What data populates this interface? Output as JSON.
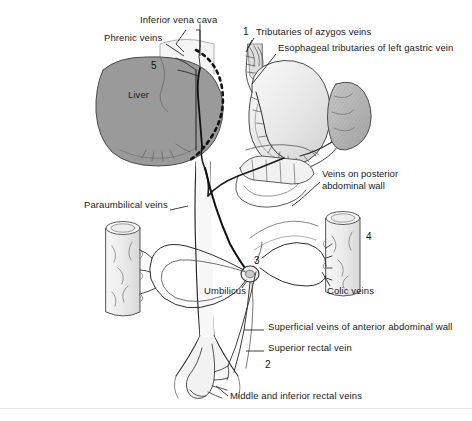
{
  "figure": {
    "domain": "diagram",
    "background_color": "#ffffff",
    "frame_line_color": "#e9e9e9",
    "ink_color": "#1a1a1a"
  },
  "palette": {
    "liver_fill": "#9a9a9a",
    "stomach_fill": "#e2e2e2",
    "spleen_fill": "#b4b4b4",
    "organ_light": "#f0f0f0",
    "wall_block_fill": "#ededed",
    "vessel_stroke": "#2b2b2b",
    "outline": "#3a3a3a"
  },
  "labels": [
    {
      "id": "inferior-vena-cava",
      "text": "Inferior vena cava",
      "x": 140,
      "y": 20
    },
    {
      "id": "phrenic-veins",
      "text": "Phrenic veins",
      "x": 104,
      "y": 38
    },
    {
      "id": "tributaries-azygos",
      "text": "Tributaries of azygos veins",
      "x": 256,
      "y": 32
    },
    {
      "id": "esophageal-left-gastric",
      "text": "Esophageal tributaries of left gastric vein",
      "x": 278,
      "y": 48
    },
    {
      "id": "veins-posterior-abdominal-wall",
      "text": "Veins on posterior\nabdominal wall",
      "x": 322,
      "y": 174
    },
    {
      "id": "paraumbilical-veins",
      "text": "Paraumbilical veins",
      "x": 84,
      "y": 205
    },
    {
      "id": "umbilicus",
      "text": "Umbilicus",
      "x": 204,
      "y": 291
    },
    {
      "id": "colic-veins",
      "text": "Colic veins",
      "x": 327,
      "y": 291
    },
    {
      "id": "superficial-veins-anterior-wall",
      "text": "Superficial veins of anterior abdominal wall",
      "x": 268,
      "y": 327
    },
    {
      "id": "superior-rectal-vein",
      "text": "Superior rectal vein",
      "x": 268,
      "y": 348
    },
    {
      "id": "middle-inferior-rectal-veins",
      "text": "Middle and inferior rectal veins",
      "x": 230,
      "y": 396
    },
    {
      "id": "liver",
      "text": "Liver",
      "x": 128,
      "y": 95
    }
  ],
  "numbers": [
    {
      "id": "marker-1",
      "text": "1",
      "x": 243,
      "y": 32
    },
    {
      "id": "marker-5",
      "text": "5",
      "x": 151,
      "y": 66
    },
    {
      "id": "marker-4",
      "text": "4",
      "x": 366,
      "y": 237
    },
    {
      "id": "marker-3",
      "text": "3",
      "x": 254,
      "y": 261
    },
    {
      "id": "marker-2",
      "text": "2",
      "x": 265,
      "y": 365
    }
  ],
  "structures": [
    {
      "id": "liver",
      "name": "liver"
    },
    {
      "id": "stomach",
      "name": "stomach"
    },
    {
      "id": "spleen",
      "name": "spleen"
    },
    {
      "id": "esophagus",
      "name": "esophagus"
    },
    {
      "id": "pancreas-duodenum",
      "name": "pancreas-and-duodenum"
    },
    {
      "id": "small-intestine",
      "name": "small-intestine-loops"
    },
    {
      "id": "transverse-colon",
      "name": "transverse-colon"
    },
    {
      "id": "left-abdominal-wall-block",
      "name": "abdominal-wall-block-left"
    },
    {
      "id": "right-abdominal-wall-block",
      "name": "abdominal-wall-block-right"
    },
    {
      "id": "inferior-vena-cava-vessel",
      "name": "inferior-vena-cava"
    },
    {
      "id": "portal-vein",
      "name": "portal-vein"
    },
    {
      "id": "paraumbilical-loop",
      "name": "paraumbilical-vein-loop"
    },
    {
      "id": "rectum",
      "name": "rectum-and-anal-canal"
    },
    {
      "id": "dashed-liver-margin",
      "name": "dashed-liver-margin"
    }
  ]
}
